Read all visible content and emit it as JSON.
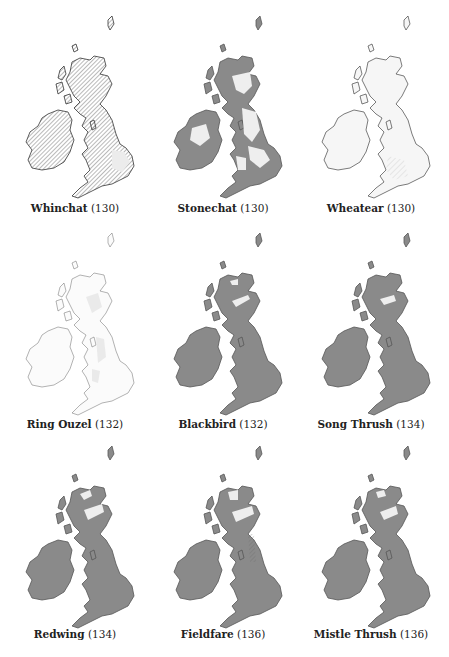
{
  "page": {
    "colors": {
      "land_fill_dark": "#8a8a8a",
      "outline": "#333333",
      "hatch": "#555555",
      "light_patch": "#e8e8e8",
      "background": "#ffffff"
    }
  },
  "maps": [
    {
      "name": "Whinchat",
      "page": "(130)",
      "style": "hatched"
    },
    {
      "name": "Stonechat",
      "page": "(130)",
      "style": "patchy-dark"
    },
    {
      "name": "Wheatear",
      "page": "(130)",
      "style": "light"
    },
    {
      "name": "Ring Ouzel",
      "page": "(132)",
      "style": "sparse"
    },
    {
      "name": "Blackbird",
      "page": "(132)",
      "style": "solid"
    },
    {
      "name": "Song Thrush",
      "page": "(134)",
      "style": "solid"
    },
    {
      "name": "Redwing",
      "page": "(134)",
      "style": "solid"
    },
    {
      "name": "Fieldfare",
      "page": "(136)",
      "style": "solid"
    },
    {
      "name": "Mistle Thrush",
      "page": "(136)",
      "style": "solid"
    }
  ]
}
